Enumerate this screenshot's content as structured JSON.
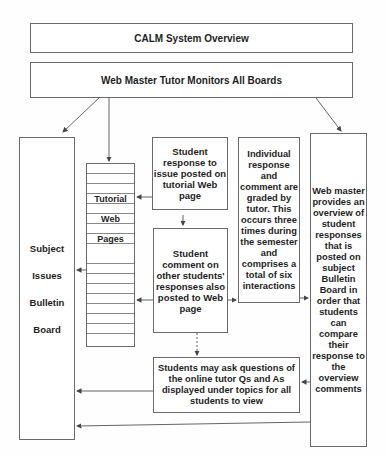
{
  "diagram": {
    "title": "CALM System Overview",
    "web_master": "Web Master Tutor Monitors All Boards",
    "bulletin_board": [
      "Subject",
      "Issues",
      "Bulletin",
      "Board"
    ],
    "tutorial_pages": [
      "Tutorial",
      "Web",
      "Pages"
    ],
    "student_response": "Student response to issue posted on tutorial Web page",
    "student_comment": "Student comment on other students' responses also posted to Web page",
    "grading": "Individual response and comment are graded by tutor. This occurs three times during the semester and comprises a total of six interactions",
    "overview": "Web master provides an overview of student responses that is posted on subject Bulletin Board in order that students can compare their response to the overview comments",
    "questions": "Students may ask questions of the online tutor Qs and As displayed under topics for all students to view"
  },
  "colors": {
    "line": "#555555",
    "border": "#6a6a6a",
    "text": "#1e1e1e"
  }
}
